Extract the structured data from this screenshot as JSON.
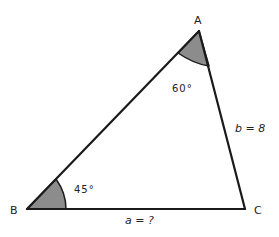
{
  "diagram": {
    "type": "triangle",
    "colors": {
      "stroke": "#1a1a1a",
      "angle_fill": "#8c8c8c",
      "background": "#ffffff",
      "text": "#222222"
    },
    "vertices": {
      "A": {
        "label": "A",
        "x": 199,
        "y": 31
      },
      "B": {
        "label": "B",
        "x": 27,
        "y": 209
      },
      "C": {
        "label": "C",
        "x": 245,
        "y": 209
      }
    },
    "angles": {
      "A": {
        "label": "60°",
        "value": 60
      },
      "B": {
        "label": "45°",
        "value": 45
      }
    },
    "sides": {
      "a": {
        "label": "a = ?",
        "between": "B-C"
      },
      "b": {
        "label": "b = 8",
        "between": "A-C"
      }
    }
  }
}
